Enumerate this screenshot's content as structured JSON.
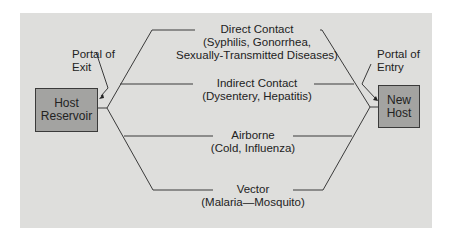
{
  "diagram": {
    "left_node": {
      "line1": "Host",
      "line2": "Reservoir"
    },
    "right_node": {
      "line1": "New",
      "line2": "Host"
    },
    "portal_exit": {
      "line1": "Portal of",
      "line2": "Exit"
    },
    "portal_entry": {
      "line1": "Portal of",
      "line2": "Entry"
    },
    "routes": [
      {
        "title": "Direct Contact",
        "line2": "(Syphilis, Gonorrhea,",
        "line3": "Sexually-Transmitted Diseases)"
      },
      {
        "title": "Indirect Contact",
        "line2": "(Dysentery, Hepatitis)"
      },
      {
        "title": "Airborne",
        "line2": "(Cold, Influenza)"
      },
      {
        "title": "Vector",
        "line2": "(Malaria—Mosquito)"
      }
    ],
    "colors": {
      "panel": "#dededc",
      "node_fill": "#a3a3a1",
      "line": "#3a3a3a"
    }
  }
}
